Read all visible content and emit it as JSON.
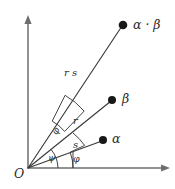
{
  "figure": {
    "background_color": "#ffffff",
    "ink_color": "#2b2b2b",
    "axis_color": "#6d6d6d",
    "origin_label": "O",
    "axes": [
      {
        "name": "vertical-axis",
        "direction": "up",
        "arrowhead": true
      },
      {
        "name": "horizontal-axis",
        "direction": "right",
        "arrowhead": true
      }
    ],
    "points": [
      {
        "id": "alpha",
        "label": "α",
        "dot": true
      },
      {
        "id": "beta",
        "label": "β",
        "dot": true
      },
      {
        "id": "alpha-beta",
        "label": "α · β",
        "dot": true
      }
    ],
    "segments": [
      {
        "id": "segment-alpha",
        "label": "s",
        "from": "O",
        "to": "alpha"
      },
      {
        "id": "segment-beta",
        "label": "r",
        "from": "O",
        "to": "beta"
      },
      {
        "id": "segment-alpha-beta",
        "label": "r s",
        "from": "O",
        "to": "alpha-beta"
      }
    ],
    "angles": [
      {
        "id": "angle-phi-base",
        "label": "φ",
        "between": "x-axis and O-alpha"
      },
      {
        "id": "angle-psi-base",
        "label": "ψ",
        "between": "x-axis and O-beta"
      },
      {
        "id": "angle-phi-upper",
        "label": "φ",
        "between": "O-beta and O-alpha-beta"
      },
      {
        "id": "angle-psi-mid",
        "label": "ψ",
        "between": "x-axis and O-beta (inner arc)"
      }
    ]
  }
}
